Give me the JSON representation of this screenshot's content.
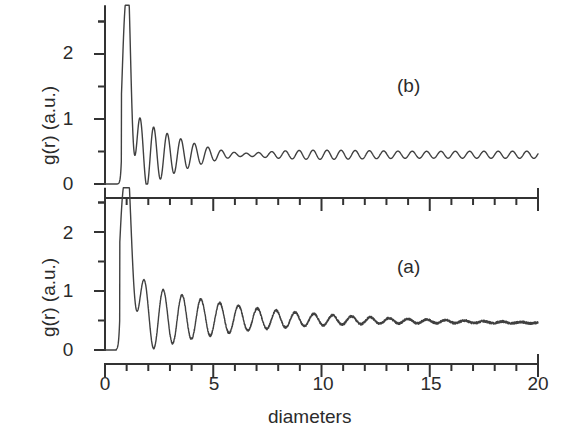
{
  "figure": {
    "background_color": "#ffffff",
    "line_color": "#404040",
    "axis_color": "#333333",
    "xlabel": "diameters",
    "ylabel_top": "g(r) (a.u.)",
    "ylabel_bottom": "g(r) (a.u.)",
    "panel_tag_top": "(b)",
    "panel_tag_bottom": "(a)"
  },
  "ticks": {
    "x_major_labels": [
      "0",
      "5",
      "10",
      "15",
      "20"
    ],
    "x_major_values": [
      0,
      5,
      10,
      15,
      20
    ],
    "x_minor_step": 1,
    "y_major_labels": [
      "0",
      "1",
      "2"
    ],
    "y_major_values": [
      0,
      1,
      2
    ],
    "y_minor_step": 0.5
  },
  "chart_data": [
    {
      "type": "line",
      "title": "(b)",
      "panel": "top",
      "xlabel": "diameters",
      "ylabel": "g(r) (a.u.)",
      "xlim": [
        0,
        20
      ],
      "ylim": [
        -0.12,
        2.75
      ],
      "grid": false,
      "legend": "none",
      "description": "Radial distribution function with a very sharp narrow first peak near r=1 reaching about 2.5, followed by rapidly damped oscillations settling to a persistent small ripple around 0.45",
      "first_peak_position": 1.0,
      "first_peak_height": 2.5,
      "asymptote": 0.45,
      "peaks": [
        {
          "r": 1.0,
          "g": 2.5
        },
        {
          "r": 1.7,
          "g": 0.88
        },
        {
          "r": 2.0,
          "g": 0.83
        },
        {
          "r": 2.6,
          "g": 0.76
        },
        {
          "r": 3.05,
          "g": 0.7
        },
        {
          "r": 3.45,
          "g": 0.68
        },
        {
          "r": 3.95,
          "g": 0.63
        },
        {
          "r": 4.4,
          "g": 0.6
        },
        {
          "r": 4.9,
          "g": 0.6
        },
        {
          "r": 5.45,
          "g": 0.58
        },
        {
          "r": 5.95,
          "g": 0.57
        },
        {
          "r": 6.5,
          "g": 0.55
        },
        {
          "r": 7.0,
          "g": 0.55
        },
        {
          "r": 7.6,
          "g": 0.54
        },
        {
          "r": 8.2,
          "g": 0.53
        },
        {
          "r": 8.8,
          "g": 0.52
        },
        {
          "r": 9.4,
          "g": 0.52
        },
        {
          "r": 10.0,
          "g": 0.51
        },
        {
          "r": 10.7,
          "g": 0.5
        },
        {
          "r": 11.3,
          "g": 0.5
        },
        {
          "r": 12.0,
          "g": 0.49
        },
        {
          "r": 12.7,
          "g": 0.49
        },
        {
          "r": 13.4,
          "g": 0.48
        },
        {
          "r": 14.1,
          "g": 0.48
        },
        {
          "r": 14.8,
          "g": 0.47
        },
        {
          "r": 15.5,
          "g": 0.47
        },
        {
          "r": 16.2,
          "g": 0.47
        },
        {
          "r": 16.9,
          "g": 0.46
        },
        {
          "r": 17.6,
          "g": 0.46
        },
        {
          "r": 18.3,
          "g": 0.46
        },
        {
          "r": 19.0,
          "g": 0.45
        },
        {
          "r": 19.7,
          "g": 0.45
        }
      ],
      "minima": [
        {
          "r": 1.35,
          "g": 0.05
        },
        {
          "r": 1.85,
          "g": 0.7
        },
        {
          "r": 2.3,
          "g": 0.07
        },
        {
          "r": 2.85,
          "g": 0.58
        },
        {
          "r": 3.25,
          "g": 0.55
        },
        {
          "r": 3.7,
          "g": 0.38
        },
        {
          "r": 4.15,
          "g": 0.45
        },
        {
          "r": 4.65,
          "g": 0.4
        },
        {
          "r": 5.15,
          "g": 0.42
        },
        {
          "r": 5.7,
          "g": 0.41
        },
        {
          "r": 6.2,
          "g": 0.41
        }
      ],
      "onset_r": 0.8,
      "zero_region": [
        0.0,
        0.8
      ],
      "series": [
        {
          "name": "g(r) sharp",
          "model": {
            "gaussian_peak": {
              "center": 1.0,
              "height": 2.45,
              "width": 0.055
            },
            "damped_wave": {
              "amplitude": 0.62,
              "decay_length": 2.6,
              "wavelength": 0.62,
              "phase": 0.0,
              "baseline": 0.45,
              "residual_amplitude": 0.055,
              "residual_wavelength": 0.66
            }
          }
        }
      ]
    },
    {
      "type": "line",
      "title": "(a)",
      "panel": "bottom",
      "xlabel": "diameters",
      "ylabel": "g(r) (a.u.)",
      "xlim": [
        0,
        20
      ],
      "ylim": [
        -0.12,
        2.75
      ],
      "grid": false,
      "legend": "none",
      "description": "Radial distribution function with a tall first peak near r=1 of about 2.5 followed by broad slowly damped oscillations that fade into a noisy nearly flat tail drifting from about 0.55 down to 0.45 by r=20",
      "first_peak_position": 0.95,
      "first_peak_height": 2.5,
      "asymptote": 0.48,
      "peaks": [
        {
          "r": 0.95,
          "g": 2.5
        },
        {
          "r": 1.85,
          "g": 1.28
        },
        {
          "r": 2.75,
          "g": 1.25
        },
        {
          "r": 3.6,
          "g": 1.18
        },
        {
          "r": 4.45,
          "g": 1.02
        },
        {
          "r": 5.3,
          "g": 0.95
        },
        {
          "r": 6.1,
          "g": 0.88
        },
        {
          "r": 6.95,
          "g": 0.85
        },
        {
          "r": 7.75,
          "g": 0.78
        },
        {
          "r": 8.6,
          "g": 0.72
        },
        {
          "r": 9.4,
          "g": 0.68
        },
        {
          "r": 10.2,
          "g": 0.64
        },
        {
          "r": 11.0,
          "g": 0.62
        },
        {
          "r": 12.0,
          "g": 0.6
        },
        {
          "r": 13.0,
          "g": 0.58
        },
        {
          "r": 14.0,
          "g": 0.56
        },
        {
          "r": 15.0,
          "g": 0.54
        },
        {
          "r": 16.0,
          "g": 0.53
        },
        {
          "r": 17.0,
          "g": 0.51
        },
        {
          "r": 18.0,
          "g": 0.5
        },
        {
          "r": 19.0,
          "g": 0.48
        },
        {
          "r": 20.0,
          "g": 0.46
        }
      ],
      "minima": [
        {
          "r": 1.4,
          "g": 0.17
        },
        {
          "r": 2.3,
          "g": 0.27
        },
        {
          "r": 3.15,
          "g": 0.4
        },
        {
          "r": 4.0,
          "g": 0.5
        },
        {
          "r": 4.9,
          "g": 0.56
        },
        {
          "r": 5.7,
          "g": 0.58
        },
        {
          "r": 6.55,
          "g": 0.6
        },
        {
          "r": 7.35,
          "g": 0.6
        },
        {
          "r": 8.2,
          "g": 0.58
        },
        {
          "r": 9.0,
          "g": 0.57
        },
        {
          "r": 9.8,
          "g": 0.55
        }
      ],
      "onset_r": 0.72,
      "zero_region": [
        0.0,
        0.72
      ],
      "series": [
        {
          "name": "g(r) broad",
          "model": {
            "gaussian_peak": {
              "center": 0.95,
              "height": 2.35,
              "width": 0.085
            },
            "damped_wave": {
              "amplitude": 0.7,
              "decay_length": 4.5,
              "wavelength": 0.87,
              "phase": 0.0,
              "baseline": 0.56,
              "baseline_slope": -0.005,
              "noise_amplitude": 0.018
            }
          }
        }
      ]
    }
  ],
  "geometry": {
    "x_axis_left_px": 105,
    "x_axis_right_px": 538,
    "top_panel_zero_px": 184,
    "top_panel_one_px": 119,
    "top_panel_two_px": 53,
    "bottom_panel_zero_px": 350,
    "bottom_panel_one_px": 291,
    "bottom_panel_two_px": 233
  }
}
